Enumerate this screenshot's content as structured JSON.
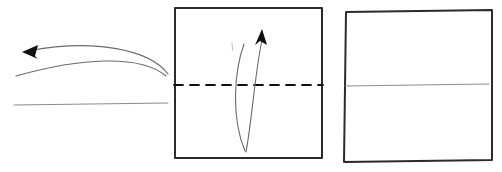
{
  "figure": {
    "canvas": {
      "width": 502,
      "height": 172,
      "background": "#ffffff"
    }
  },
  "colors": {
    "outline": "#1a1a1a",
    "frame_stroke": "#2b2b2b",
    "curve_stroke": "#6b6b6b",
    "light_line": "#8c8c8c",
    "dashed_fold": "#111111",
    "arrow_fill": "#111111",
    "background": "#ffffff"
  },
  "panels": [
    {
      "id": "panel-left",
      "name": "motion-arrow-panel",
      "label": "Step 1 - turn over",
      "elements": [
        {
          "name": "upper-motion-arc",
          "type": "arc",
          "path": "M 168 74 C 150 50 95 38 28 51",
          "stroke": "#6b6b6b",
          "stroke_width": 1.1
        },
        {
          "name": "lower-motion-arc",
          "type": "arc",
          "path": "M 166 76 C 140 54 80 58 16 76",
          "stroke": "#6b6b6b",
          "stroke_width": 1.1
        },
        {
          "name": "left-arrow-head",
          "type": "triangle",
          "points": "22,52 38,45 35,56 38,59",
          "fill": "#111111"
        },
        {
          "name": "baseline-edge",
          "type": "line",
          "path": "M 14 105 L 168 103",
          "stroke": "#8c8c8c",
          "stroke_width": 1
        }
      ]
    },
    {
      "id": "panel-middle",
      "name": "fold-square-panel",
      "label": "Step 2 - valley fold on dashed line",
      "elements": [
        {
          "name": "square-outline",
          "type": "rect",
          "path": "M 175 8 L 322 8 L 322 158 L 175 158 Z",
          "stroke": "#2b2b2b",
          "stroke_width": 2
        },
        {
          "name": "dashed-fold-line",
          "type": "dashed-line",
          "path": "M 174 85 L 323 85",
          "stroke": "#111111",
          "stroke_width": 1.8,
          "dash": "9 7"
        },
        {
          "name": "fold-arc-left",
          "type": "arc",
          "path": "M 245 151 C 231 118 234 72 244 44",
          "stroke": "#6b6b6b",
          "stroke_width": 1.1
        },
        {
          "name": "fold-arc-right",
          "type": "arc",
          "path": "M 246 152 C 252 120 255 72 262 40",
          "stroke": "#6b6b6b",
          "stroke_width": 1.1
        },
        {
          "name": "up-arrow-head",
          "type": "triangle",
          "points": "262,29 267,45 260,41 255,45",
          "fill": "#111111"
        },
        {
          "name": "crease-tick-mark",
          "type": "tick",
          "path": "M 232 43 L 232.5 50",
          "stroke": "#b5b5b5",
          "stroke_width": 0.9
        }
      ]
    },
    {
      "id": "panel-right",
      "name": "folded-result-panel",
      "label": "Step 3 - creased result",
      "elements": [
        {
          "name": "folded-square-outline",
          "type": "quad",
          "path": "M 346 12 L 492 10 L 492 160 L 344 162 Z",
          "stroke": "#2b2b2b",
          "stroke_width": 2
        },
        {
          "name": "crease-line",
          "type": "line",
          "path": "M 345 86 L 489 84",
          "stroke": "#8c8c8c",
          "stroke_width": 1
        }
      ]
    }
  ]
}
